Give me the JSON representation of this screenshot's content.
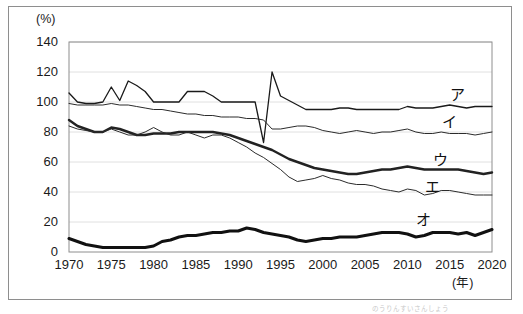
{
  "figure": {
    "y_axis_unit": "(%)",
    "x_axis_unit": "(年)",
    "footnote": "のうりんすいさんしょう"
  },
  "chart_data": {
    "type": "line",
    "title": "",
    "xlabel": "(年)",
    "ylabel": "(%)",
    "xlim": [
      1970,
      2020
    ],
    "ylim": [
      0,
      140
    ],
    "grid": true,
    "legend_position": "inline-right",
    "yticks": [
      0,
      20,
      40,
      60,
      80,
      100,
      120,
      140
    ],
    "ytick_labels": [
      "0",
      "20",
      "40",
      "60",
      "80",
      "100",
      "120",
      "140"
    ],
    "xticks": [
      1970,
      1975,
      1980,
      1985,
      1990,
      1995,
      2000,
      2005,
      2010,
      2015,
      2020
    ],
    "xtick_labels": [
      "1970",
      "1975",
      "1980",
      "1985",
      "1990",
      "1995",
      "2000",
      "2005",
      "2010",
      "2015",
      "2020"
    ],
    "x": [
      1970,
      1971,
      1972,
      1973,
      1974,
      1975,
      1976,
      1977,
      1978,
      1979,
      1980,
      1981,
      1982,
      1983,
      1984,
      1985,
      1986,
      1987,
      1988,
      1989,
      1990,
      1991,
      1992,
      1993,
      1994,
      1995,
      1996,
      1997,
      1998,
      1999,
      2000,
      2001,
      2002,
      2003,
      2004,
      2005,
      2006,
      2007,
      2008,
      2009,
      2010,
      2011,
      2012,
      2013,
      2014,
      2015,
      2016,
      2017,
      2018,
      2019,
      2020
    ],
    "series": [
      {
        "name": "ア",
        "label": "ア",
        "color": "#1a1a1a",
        "width": 1.3,
        "label_x": 2016,
        "label_y": 106,
        "values": [
          106,
          100,
          99,
          99,
          100,
          110,
          101,
          114,
          111,
          107,
          100,
          100,
          100,
          100,
          107,
          107,
          107,
          104,
          100,
          100,
          100,
          100,
          100,
          73,
          120,
          104,
          101,
          98,
          95,
          95,
          95,
          95,
          96,
          96,
          95,
          95,
          95,
          95,
          95,
          95,
          97,
          96,
          96,
          96,
          97,
          98,
          97,
          96,
          97,
          97,
          97
        ]
      },
      {
        "name": "イ",
        "label": "イ",
        "color": "#2b2b2b",
        "width": 1.0,
        "label_x": 2015,
        "label_y": 88,
        "values": [
          99,
          98,
          98,
          98,
          98,
          99,
          98,
          98,
          97,
          96,
          95,
          95,
          94,
          93,
          92,
          92,
          91,
          91,
          90,
          90,
          90,
          89,
          89,
          88,
          82,
          82,
          83,
          84,
          84,
          83,
          81,
          80,
          79,
          80,
          81,
          80,
          79,
          80,
          80,
          81,
          82,
          80,
          79,
          79,
          80,
          79,
          79,
          79,
          78,
          79,
          80
        ]
      },
      {
        "name": "ウ",
        "label": "ウ",
        "color": "#222222",
        "width": 2.4,
        "label_x": 2014,
        "label_y": 63,
        "values": [
          88,
          84,
          82,
          80,
          80,
          83,
          82,
          80,
          78,
          78,
          79,
          79,
          79,
          80,
          80,
          80,
          80,
          80,
          79,
          78,
          76,
          74,
          72,
          70,
          68,
          65,
          62,
          60,
          58,
          56,
          55,
          54,
          53,
          52,
          52,
          53,
          54,
          55,
          55,
          56,
          57,
          56,
          55,
          55,
          55,
          55,
          55,
          54,
          53,
          52,
          53
        ]
      },
      {
        "name": "エ",
        "label": "エ",
        "color": "#2b2b2b",
        "width": 1.0,
        "label_x": 2013,
        "label_y": 45,
        "values": [
          84,
          82,
          81,
          80,
          80,
          82,
          80,
          78,
          78,
          80,
          83,
          80,
          78,
          78,
          80,
          78,
          76,
          78,
          78,
          76,
          73,
          70,
          66,
          63,
          59,
          55,
          50,
          47,
          48,
          49,
          51,
          49,
          48,
          46,
          45,
          45,
          44,
          42,
          41,
          40,
          42,
          41,
          38,
          39,
          41,
          41,
          40,
          39,
          38,
          38,
          38
        ]
      },
      {
        "name": "オ",
        "label": "オ",
        "color": "#111111",
        "width": 3.0,
        "label_x": 2012,
        "label_y": 23,
        "values": [
          9,
          7,
          5,
          4,
          3,
          3,
          3,
          3,
          3,
          3,
          4,
          7,
          8,
          10,
          11,
          11,
          12,
          13,
          13,
          14,
          14,
          16,
          15,
          13,
          12,
          11,
          10,
          8,
          7,
          8,
          9,
          9,
          10,
          10,
          10,
          11,
          12,
          13,
          13,
          13,
          12,
          10,
          11,
          13,
          13,
          13,
          12,
          13,
          11,
          13,
          15
        ]
      }
    ]
  }
}
